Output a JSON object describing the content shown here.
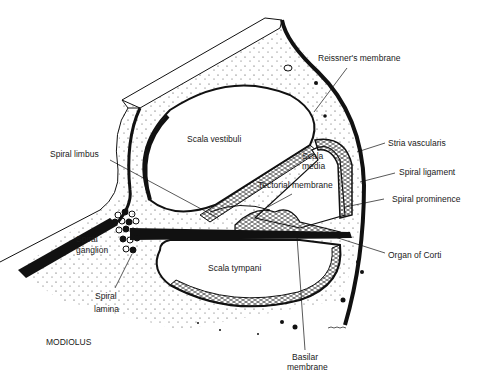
{
  "colors": {
    "ink": "#111111",
    "background": "#ffffff",
    "tissue": "#f7f7f7"
  },
  "labels": {
    "reissners_membrane": "Reissner's membrane",
    "scala_vestibuli": "Scala vestibuli",
    "stria_vascularis": "Stria vascularis",
    "scala_media_1": "Scala",
    "scala_media_2": "media",
    "spiral_limbus": "Spiral limbus",
    "spiral_ligament": "Spiral ligament",
    "tectorial_membrane": "Tectorial membrane",
    "spiral_prominence": "Spiral prominence",
    "spiral_ganglion_1": "Spiral",
    "spiral_ganglion_2": "ganglion",
    "organ_of_corti": "Organ of Corti",
    "scala_tympani": "Scala tympani",
    "spiral_lamina_1": "Spiral",
    "spiral_lamina_2": "lamina",
    "modiolus": "MODIOLUS",
    "basilar_membrane_1": "Basilar",
    "basilar_membrane_2": "membrane"
  }
}
